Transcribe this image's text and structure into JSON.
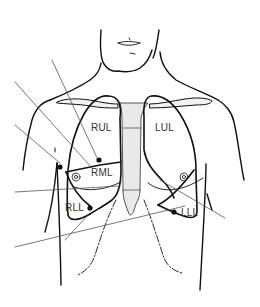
{
  "diagram": {
    "labels": {
      "rul": "RUL",
      "rml": "RML",
      "rll": "RLL",
      "lul": "LUL",
      "lll": "LLL"
    },
    "colors": {
      "outline": "#111111",
      "mediastinum_fill": "#e9e9e9",
      "leader_line": "#555555",
      "background": "#ffffff"
    }
  }
}
